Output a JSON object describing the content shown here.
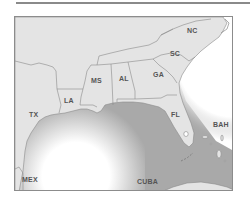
{
  "map": {
    "title": "",
    "colors": {
      "land": "#e4e4e4",
      "border": "#8a8a8a",
      "gulf_water": "#a9a9a9",
      "atlantic_water": "#ffffff",
      "label": "#555555",
      "frame": "#8c8c8c"
    },
    "labels": [
      {
        "id": "NC",
        "text": "NC",
        "x": 187,
        "y": 27
      },
      {
        "id": "SC",
        "text": "SC",
        "x": 170,
        "y": 50
      },
      {
        "id": "GA",
        "text": "GA",
        "x": 153,
        "y": 71
      },
      {
        "id": "AL",
        "text": "AL",
        "x": 119,
        "y": 75
      },
      {
        "id": "MS",
        "text": "MS",
        "x": 91,
        "y": 77
      },
      {
        "id": "LA",
        "text": "LA",
        "x": 64,
        "y": 97
      },
      {
        "id": "TX",
        "text": "TX",
        "x": 29,
        "y": 111
      },
      {
        "id": "FL",
        "text": "FL",
        "x": 171,
        "y": 111
      },
      {
        "id": "BAH",
        "text": "BAH",
        "x": 213,
        "y": 121
      },
      {
        "id": "MEX",
        "text": "MEX",
        "x": 22,
        "y": 176
      },
      {
        "id": "CUBA",
        "text": "CUBA",
        "x": 137,
        "y": 178
      }
    ]
  }
}
